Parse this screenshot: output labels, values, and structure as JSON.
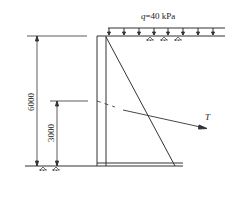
{
  "diagram": {
    "type": "retaining-wall-anchor",
    "load_label": "q=40 kPa",
    "load_symbol": "q",
    "load_value": "40 kPa",
    "dimension_total": "6000",
    "dimension_anchor": "3000",
    "anchor_force_label": "T",
    "colors": {
      "line": "#333333",
      "background": "#ffffff"
    },
    "load_arrow_count": 8
  }
}
